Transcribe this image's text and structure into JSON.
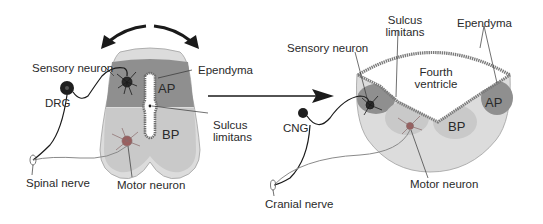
{
  "left_panel": {
    "title": "Spinal cord cross-section",
    "labels": {
      "sensory_neuron": "Sensory neuron",
      "ependyma": "Ependyma",
      "ap": "AP",
      "bp": "BP",
      "drg": "DRG",
      "sulcus_limitans_1": "Sulcus",
      "sulcus_limitans_2": "limitans",
      "spinal_nerve": "Spinal nerve",
      "motor_neuron": "Motor neuron"
    }
  },
  "right_panel": {
    "title": "Hindbrain cross-section",
    "labels": {
      "sulcus_limitans_1": "Sulcus",
      "sulcus_limitans_2": "limitans",
      "ependyma": "Ependyma",
      "sensory_neuron": "Sensory neuron",
      "fourth_ventricle_1": "Fourth",
      "fourth_ventricle_2": "ventricle",
      "ap": "AP",
      "bp": "BP",
      "cng": "CNG",
      "cranial_nerve": "Cranial nerve",
      "motor_neuron": "Motor neuron"
    }
  },
  "colors": {
    "outer_tissue": "#d9d9d9",
    "alar_plate": "#8f8f8f",
    "basal_plate": "#c6c6c6",
    "ependyma": "#7a7a7a",
    "ventricle": "#ffffff",
    "line": "#1a1a1a"
  }
}
